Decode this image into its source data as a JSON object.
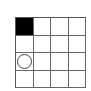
{
  "board": {
    "rows": 4,
    "cols": 4,
    "cells": [
      [
        "filled",
        "empty",
        "empty",
        "empty"
      ],
      [
        "empty",
        "empty",
        "empty",
        "empty"
      ],
      [
        "circle",
        "empty",
        "empty",
        "empty"
      ],
      [
        "empty",
        "empty",
        "empty",
        "empty"
      ]
    ]
  },
  "colors": {
    "filled": "#000000",
    "grid_line": "#666666",
    "background": "#ffffff"
  }
}
